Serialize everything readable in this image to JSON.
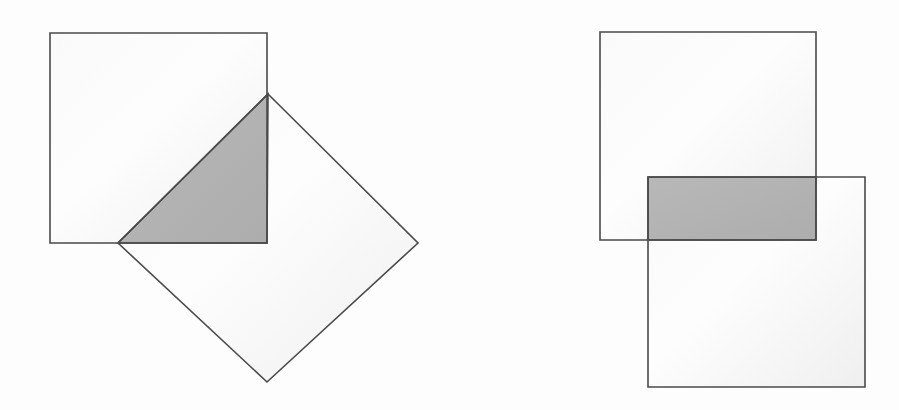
{
  "figure": {
    "canvas_width": 899,
    "canvas_height": 410,
    "background_color": "#fdfdfd",
    "stroke_color": "#4a4a4a",
    "stroke_width": 1.6,
    "light_fill_color": "#f2f2f2",
    "shaded_fill_color": "#b3b3b3"
  },
  "panels": [
    {
      "id": "left-panel",
      "label": "Square and rotated square (diamond) intersection",
      "shapes": [
        {
          "id": "left-axis-aligned-square",
          "name": "square",
          "type": "polygon",
          "points": "50,33 267,33 267,243 50,243",
          "fill": "#f2f2f2",
          "stroke": "#4a4a4a"
        },
        {
          "id": "left-rotated-square",
          "name": "diamond",
          "type": "polygon",
          "points": "268,94 418,243 267,382 118,243",
          "fill": "#f2f2f2",
          "stroke": "#4a4a4a"
        }
      ],
      "intersection": {
        "id": "left-intersection-triangle",
        "name": "shaded-triangle",
        "type": "polygon",
        "points": "268,94 267,243 118,243",
        "fill": "#b3b3b3",
        "stroke": "#4a4a4a"
      }
    },
    {
      "id": "right-panel",
      "label": "Two offset squares intersection",
      "shapes": [
        {
          "id": "right-upper-square",
          "name": "upper-square",
          "type": "polygon",
          "points": "600,32 816,32 816,240 600,240",
          "fill": "#f2f2f2",
          "stroke": "#4a4a4a"
        },
        {
          "id": "right-lower-square",
          "name": "lower-square",
          "type": "polygon",
          "points": "648,177 865,177 865,387 648,387",
          "fill": "#f2f2f2",
          "stroke": "#4a4a4a"
        }
      ],
      "intersection": {
        "id": "right-intersection-rectangle",
        "name": "shaded-rectangle",
        "type": "polygon",
        "points": "648,177 816,177 816,240 648,240",
        "fill": "#b3b3b3",
        "stroke": "#4a4a4a"
      }
    }
  ]
}
